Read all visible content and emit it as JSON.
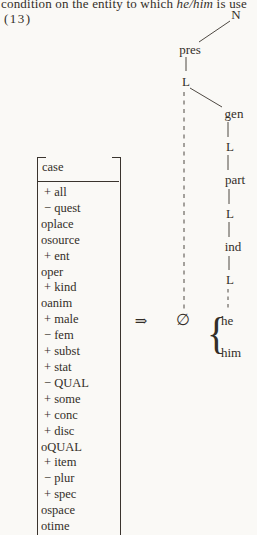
{
  "colors": {
    "ink": "#332e28",
    "background": "#faf9f6"
  },
  "page": {
    "top_line_pre": "condition on the entity to which ",
    "top_line_italic": "he/him",
    "top_line_post": " is use",
    "example_number": "(13)"
  },
  "tree": {
    "root": "N",
    "pres": "pres",
    "l1": "L",
    "gen": "gen",
    "l2": "L",
    "part": "part",
    "l3": "L",
    "ind": "ind",
    "l4": "L",
    "null_symbol": "∅",
    "arrow": "⇒",
    "brace": "{",
    "lex_top": "he",
    "lex_bottom": "him"
  },
  "matrix": {
    "header": "case",
    "rows": [
      "+ all",
      "− quest",
      "oplace",
      "osource",
      "+ ent",
      "oper",
      "+ kind",
      "oanim",
      "+ male",
      "− fem",
      "+ subst",
      "+ stat",
      "− QUAL",
      "+ some",
      "+ conc",
      "+ disc",
      "oQUAL",
      "+ item",
      "− plur",
      "+ spec",
      "ospace",
      "otime"
    ]
  }
}
